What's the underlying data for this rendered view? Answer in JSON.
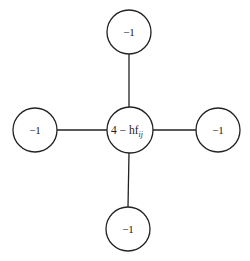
{
  "diagram": {
    "type": "five-point stencil",
    "center": {
      "label": "4 − hf",
      "subscript": "ij",
      "x": 130,
      "y": 130,
      "r": 23
    },
    "neighbors": [
      {
        "id": "top",
        "label": "−1",
        "x": 129,
        "y": 32,
        "r": 22
      },
      {
        "id": "left",
        "label": "−1",
        "x": 35,
        "y": 130,
        "r": 22
      },
      {
        "id": "right",
        "label": "−1",
        "x": 218,
        "y": 130,
        "r": 22
      },
      {
        "id": "bottom",
        "label": "−1",
        "x": 128,
        "y": 229,
        "r": 22
      }
    ],
    "stroke_color": "#222222"
  }
}
